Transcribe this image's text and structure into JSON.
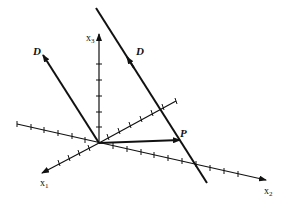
{
  "diagram": {
    "type": "3d-coordinate-axes",
    "axes": [
      {
        "name": "x1",
        "base": "x",
        "sub": "1"
      },
      {
        "name": "x2",
        "base": "x",
        "sub": "2"
      },
      {
        "name": "x3",
        "base": "x",
        "sub": "3"
      }
    ],
    "labels": {
      "x1_base": "x",
      "x1_sub": "1",
      "x2_base": "x",
      "x2_sub": "2",
      "x3_base": "x",
      "x3_sub": "3",
      "direction_left": "D",
      "direction_right": "D",
      "point": "P"
    },
    "elements": [
      {
        "id": "direction-vector-D",
        "label": "D",
        "description": "direction vector from origin"
      },
      {
        "id": "line-through-P",
        "label": "D",
        "description": "line through P parallel to D"
      },
      {
        "id": "position-vector-P",
        "label": "P",
        "description": "vector from origin to point P"
      }
    ],
    "colors": {
      "stroke": "#111111",
      "background": "#ffffff"
    }
  }
}
